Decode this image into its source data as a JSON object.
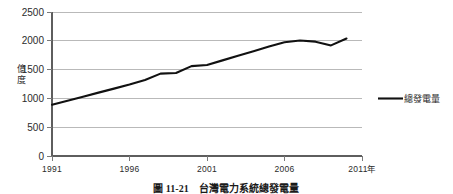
{
  "figure": {
    "caption": "圖 11-21　台灣電力系統總發電量",
    "y_axis_title": "億度",
    "x_axis_unit_suffix": "年"
  },
  "legend": {
    "position": "right",
    "entries": [
      {
        "label": "總發電量",
        "color": "#111111",
        "marker": "line"
      }
    ]
  },
  "colors": {
    "series": "#111111",
    "grid": "#b9b9b9",
    "axis": "#5e5e5e",
    "background": "#ffffff",
    "text": "#2b2b2b"
  },
  "chart_data": {
    "type": "line",
    "title": "",
    "xlabel": "年",
    "ylabel": "億度",
    "xlim": [
      1991,
      2011
    ],
    "ylim": [
      0,
      2500
    ],
    "ytick_values": [
      0,
      500,
      1000,
      1500,
      2000,
      2500
    ],
    "ytick_labels": [
      "0",
      "500",
      "1000",
      "1500",
      "2000",
      "2500"
    ],
    "xtick_values": [
      1991,
      1996,
      2001,
      2006,
      2011
    ],
    "xtick_labels": [
      "1991",
      "1996",
      "2001",
      "2006",
      "2011"
    ],
    "grid": "horizontal",
    "legend_position": "right",
    "x": [
      1991,
      1992,
      1993,
      1994,
      1995,
      1996,
      1997,
      1998,
      1999,
      2000,
      2001,
      2002,
      2003,
      2004,
      2005,
      2006,
      2007,
      2008,
      2009,
      2010
    ],
    "series": [
      {
        "name": "總發電量",
        "color": "#111111",
        "values": [
          890,
          960,
          1030,
          1100,
          1170,
          1240,
          1320,
          1430,
          1440,
          1560,
          1580,
          1660,
          1740,
          1820,
          1900,
          1975,
          2005,
          1985,
          1920,
          2040
        ]
      }
    ]
  }
}
